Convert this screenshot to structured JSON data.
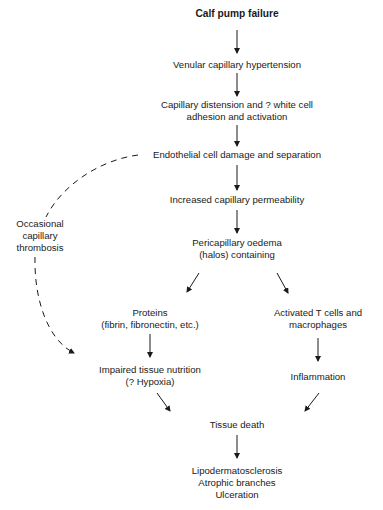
{
  "diagram": {
    "type": "flowchart",
    "nodes": [
      {
        "id": "calf",
        "lines": [
          "Calf pump failure"
        ],
        "bold": true
      },
      {
        "id": "venular",
        "lines": [
          "Venular capillary hypertension"
        ]
      },
      {
        "id": "distension",
        "lines": [
          "Capillary distension and ? white cell",
          "adhesion and activation"
        ]
      },
      {
        "id": "endothelial",
        "lines": [
          "Endothelial cell damage and separation"
        ]
      },
      {
        "id": "permeability",
        "lines": [
          "Increased capillary permeability"
        ]
      },
      {
        "id": "oedema",
        "lines": [
          "Pericapillary oedema",
          "(halos) containing"
        ]
      },
      {
        "id": "thrombosis",
        "lines": [
          "Occasional",
          "capillary",
          "thrombosis"
        ]
      },
      {
        "id": "proteins",
        "lines": [
          "Proteins",
          "(fibrin, fibronectin, etc.)"
        ]
      },
      {
        "id": "tcells",
        "lines": [
          "Activated T cells and",
          "macrophages"
        ]
      },
      {
        "id": "impaired",
        "lines": [
          "Impaired tissue nutrition",
          "(? Hypoxia)"
        ]
      },
      {
        "id": "inflammation",
        "lines": [
          "Inflammation"
        ]
      },
      {
        "id": "death",
        "lines": [
          "Tissue death"
        ]
      },
      {
        "id": "outcomes",
        "lines": [
          "Lipodermatosclerosis",
          "Atrophic branches",
          "Ulceration"
        ]
      }
    ],
    "edges": [
      {
        "from": "calf",
        "to": "venular",
        "style": "solid"
      },
      {
        "from": "venular",
        "to": "distension",
        "style": "solid"
      },
      {
        "from": "distension",
        "to": "endothelial",
        "style": "solid"
      },
      {
        "from": "endothelial",
        "to": "permeability",
        "style": "solid"
      },
      {
        "from": "permeability",
        "to": "oedema",
        "style": "solid"
      },
      {
        "from": "oedema",
        "to": "proteins",
        "style": "solid"
      },
      {
        "from": "oedema",
        "to": "tcells",
        "style": "solid"
      },
      {
        "from": "proteins",
        "to": "impaired",
        "style": "solid"
      },
      {
        "from": "tcells",
        "to": "inflammation",
        "style": "solid"
      },
      {
        "from": "impaired",
        "to": "death",
        "style": "solid"
      },
      {
        "from": "inflammation",
        "to": "death",
        "style": "solid"
      },
      {
        "from": "death",
        "to": "outcomes",
        "style": "solid"
      },
      {
        "from": "endothelial",
        "to": "impaired",
        "style": "dashed",
        "via": "thrombosis"
      }
    ]
  }
}
